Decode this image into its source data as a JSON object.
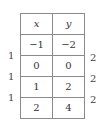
{
  "table": {
    "headers": [
      "x",
      "y"
    ],
    "rows": [
      [
        "−1",
        "−2"
      ],
      [
        "0",
        "0"
      ],
      [
        "1",
        "2"
      ],
      [
        "2",
        "4"
      ]
    ]
  },
  "differences": {
    "x_steps": [
      "1",
      "1",
      "1"
    ],
    "y_steps": [
      "2",
      "2",
      "2"
    ]
  }
}
